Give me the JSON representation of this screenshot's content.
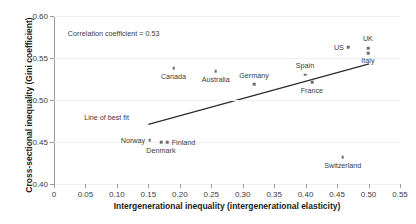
{
  "chart_data": {
    "type": "scatter",
    "title": "",
    "xlabel": "Intergenerational inequality (intergenerational elasticity)",
    "ylabel": "Cross-sectional inequality (Gini coefficient)",
    "xlim": [
      0,
      0.55
    ],
    "ylim": [
      0.4,
      0.6
    ],
    "xticks": [
      "0",
      "0.05",
      "0.10",
      "0.15",
      "0.20",
      "0.25",
      "0.30",
      "0.35",
      "0.40",
      "0.45",
      "0.50",
      "0.55"
    ],
    "xtick_values": [
      0,
      0.05,
      0.1,
      0.15,
      0.2,
      0.25,
      0.3,
      0.35,
      0.4,
      0.45,
      0.5,
      0.55
    ],
    "yticks": [
      "0.40",
      "0.45",
      "0.50",
      "0.55",
      "0.60"
    ],
    "ytick_values": [
      0.4,
      0.45,
      0.5,
      0.55,
      0.6
    ],
    "grid": true,
    "legend": "none",
    "marker_color": "#6e6e6e",
    "line_color": "#2b2b2b",
    "points": [
      {
        "label": "Norway",
        "x": 0.152,
        "y": 0.452,
        "label_pos": "left"
      },
      {
        "label": "Denmark",
        "x": 0.17,
        "y": 0.45,
        "label_pos": "below"
      },
      {
        "label": "Finland",
        "x": 0.18,
        "y": 0.45,
        "label_pos": "right"
      },
      {
        "label": "Canada",
        "x": 0.19,
        "y": 0.538,
        "label_pos": "below"
      },
      {
        "label": "Australia",
        "x": 0.257,
        "y": 0.534,
        "label_pos": "below"
      },
      {
        "label": "Germany",
        "x": 0.318,
        "y": 0.519,
        "label_pos": "above"
      },
      {
        "label": "Spain",
        "x": 0.399,
        "y": 0.53,
        "label_pos": "above"
      },
      {
        "label": "France",
        "x": 0.41,
        "y": 0.521,
        "label_pos": "below"
      },
      {
        "label": "Switzerland",
        "x": 0.459,
        "y": 0.432,
        "label_pos": "below"
      },
      {
        "label": "US",
        "x": 0.468,
        "y": 0.563,
        "label_pos": "left"
      },
      {
        "label": "UK",
        "x": 0.499,
        "y": 0.562,
        "label_pos": "above"
      },
      {
        "label": "Italy",
        "x": 0.499,
        "y": 0.556,
        "label_pos": "below"
      }
    ],
    "fit_line": {
      "label": "Line of best fit",
      "x1": 0.15,
      "y1": 0.471,
      "x2": 0.501,
      "y2": 0.543
    },
    "annotations": [
      {
        "name": "correlation",
        "text": "Correlation coefficient = 0.53",
        "x": 0.022,
        "y": 0.585
      },
      {
        "name": "fit-line-label",
        "text": "Line of best fit",
        "x": 0.048,
        "y": 0.484
      }
    ]
  }
}
